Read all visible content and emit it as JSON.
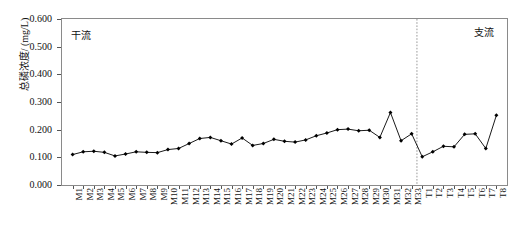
{
  "chart_data": {
    "type": "line",
    "title": "",
    "xlabel": "",
    "ylabel": "总磷浓度/ (mg/L)",
    "ylim": [
      0.0,
      0.6
    ],
    "ytick_labels": [
      "0.600",
      "0.500",
      "0.400",
      "0.300",
      "0.200",
      "0.100",
      "0.000"
    ],
    "ytick_values": [
      0.6,
      0.5,
      0.4,
      0.3,
      0.2,
      0.1,
      0.0
    ],
    "grid": false,
    "legend": "none",
    "marker": "filled-diamond",
    "line_color": "#000000",
    "categories": [
      "M1",
      "M2",
      "M3",
      "M4",
      "M5",
      "M6",
      "M7",
      "M8",
      "M9",
      "M10",
      "M11",
      "M12",
      "M13",
      "M14",
      "M15",
      "M16",
      "M17",
      "M18",
      "M19",
      "M20",
      "M21",
      "M22",
      "M23",
      "M24",
      "M25",
      "M26",
      "M27",
      "M28",
      "M29",
      "M30",
      "M31",
      "M32",
      "M33",
      "T1",
      "T2",
      "T3",
      "T4",
      "T5",
      "T6",
      "T7",
      "T8"
    ],
    "values": [
      0.11,
      0.12,
      0.122,
      0.118,
      0.105,
      0.112,
      0.12,
      0.118,
      0.117,
      0.128,
      0.132,
      0.15,
      0.168,
      0.172,
      0.16,
      0.148,
      0.17,
      0.143,
      0.15,
      0.165,
      0.158,
      0.155,
      0.163,
      0.178,
      0.188,
      0.2,
      0.202,
      0.196,
      0.198,
      0.172,
      0.262,
      0.16,
      0.185,
      0.102,
      0.12,
      0.14,
      0.138,
      0.183,
      0.185,
      0.132,
      0.252
    ],
    "annotations": [
      {
        "text": "干流",
        "position": "top-left",
        "meaning": "main-stream-section"
      },
      {
        "text": "支流",
        "position": "top-right",
        "meaning": "tributary-section"
      }
    ],
    "divider": {
      "after_category": "M33",
      "style": "dotted",
      "color": "#999999"
    }
  }
}
